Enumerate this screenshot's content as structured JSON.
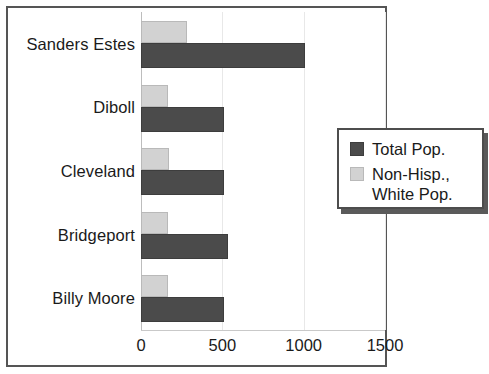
{
  "chart_data": {
    "type": "bar",
    "orientation": "horizontal",
    "title": "",
    "xlabel": "",
    "ylabel": "",
    "xlim": [
      0,
      1500
    ],
    "xticks": [
      "0",
      "500",
      "1000",
      "1500"
    ],
    "grid": true,
    "legend_position": "right",
    "categories": [
      "Sanders Estes",
      "Diboll",
      "Cleveland",
      "Bridgeport",
      "Billy Moore"
    ],
    "series": [
      {
        "name": "Total Pop.",
        "color": "#4b4b4b",
        "values": [
          1010,
          510,
          510,
          535,
          510
        ]
      },
      {
        "name": "Non-Hisp., White Pop.",
        "color": "#d2d2d2",
        "values": [
          280,
          165,
          175,
          165,
          165
        ]
      }
    ]
  },
  "legend": {
    "entries": [
      {
        "label": "Total Pop."
      },
      {
        "label": "Non-Hisp.,\nWhite Pop."
      }
    ]
  }
}
